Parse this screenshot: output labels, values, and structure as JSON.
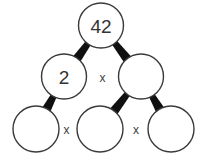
{
  "diagram": {
    "type": "factor-tree",
    "background_color": "#ffffff",
    "circle_stroke_color": "#3a3a3a",
    "connector_color": "#101010",
    "text_color": "#333333",
    "rows": [
      {
        "row_name": "top-row",
        "nodes": [
          {
            "id": "top",
            "value": "42",
            "filled": true,
            "cx": 101,
            "cy": 25.5,
            "r": 22.5
          }
        ],
        "operators": []
      },
      {
        "row_name": "middle-row",
        "nodes": [
          {
            "id": "mid-left",
            "value": "2",
            "filled": true,
            "cx": 64,
            "cy": 76.5,
            "r": 22.5
          },
          {
            "id": "mid-right",
            "value": "",
            "filled": false,
            "cx": 141,
            "cy": 76.5,
            "r": 22.5
          }
        ],
        "operators": [
          {
            "id": "op-middle",
            "symbol": "x",
            "x": 102.5,
            "y": 78
          }
        ]
      },
      {
        "row_name": "bottom-row",
        "nodes": [
          {
            "id": "bottom-left",
            "value": "",
            "filled": false,
            "cx": 36,
            "cy": 129,
            "r": 23
          },
          {
            "id": "bottom-center",
            "value": "",
            "filled": false,
            "cx": 100,
            "cy": 129,
            "r": 23
          },
          {
            "id": "bottom-right",
            "value": "",
            "filled": false,
            "cx": 171,
            "cy": 129,
            "r": 23
          }
        ],
        "operators": [
          {
            "id": "op-bottom-left",
            "symbol": "x",
            "x": 66.5,
            "y": 130
          },
          {
            "id": "op-bottom-right",
            "symbol": "x",
            "x": 136,
            "y": 130
          }
        ]
      }
    ],
    "connectors": [
      {
        "id": "connector-top-to-mid-left",
        "from": "top",
        "to": "mid-left"
      },
      {
        "id": "connector-top-to-mid-right",
        "from": "top",
        "to": "mid-right"
      },
      {
        "id": "connector-mid-left-to-bottom-left",
        "from": "mid-left",
        "to": "bottom-left"
      },
      {
        "id": "connector-mid-right-to-bottom-center",
        "from": "mid-right",
        "to": "bottom-center"
      },
      {
        "id": "connector-mid-right-to-bottom-right",
        "from": "mid-right",
        "to": "bottom-right"
      }
    ]
  }
}
